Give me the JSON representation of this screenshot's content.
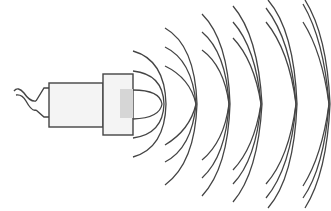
{
  "diagram": {
    "colors": {
      "stroke": "#444444",
      "body_fill": "#f4f4f4",
      "lens_fill": "#d6d6d6",
      "background": "#ffffff"
    },
    "components": [
      "cable",
      "connector",
      "emitter-body",
      "emitter-head",
      "transducer-face",
      "wavefronts"
    ],
    "wavefront_groups": 6,
    "arcs_per_group": 3
  }
}
